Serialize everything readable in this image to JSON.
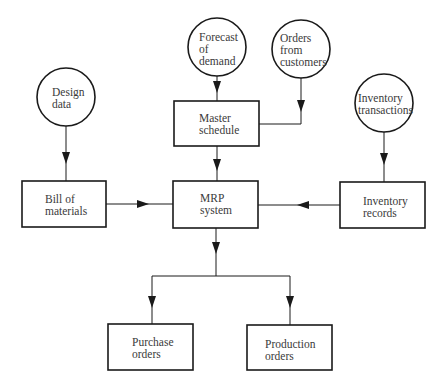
{
  "diagram": {
    "type": "flowchart",
    "title": "",
    "inputs": [
      {
        "id": "design_data",
        "shape": "circle",
        "label": "Design\ndata"
      },
      {
        "id": "forecast",
        "shape": "circle",
        "label": "Forecast\nof\ndemand"
      },
      {
        "id": "orders_customers",
        "shape": "circle",
        "label": "Orders\nfrom\ncustomers"
      },
      {
        "id": "inventory_transactions",
        "shape": "circle",
        "label": "Inventory\ntransactions"
      }
    ],
    "processes": [
      {
        "id": "master_schedule",
        "shape": "box",
        "label": "Master\nschedule"
      },
      {
        "id": "bill_of_materials",
        "shape": "box",
        "label": "Bill of\nmaterials"
      },
      {
        "id": "mrp_system",
        "shape": "box",
        "label": "MRP\nsystem"
      },
      {
        "id": "inventory_records",
        "shape": "box",
        "label": "Inventory\nrecords"
      }
    ],
    "outputs": [
      {
        "id": "purchase_orders",
        "shape": "box",
        "label": "Purchase\norders"
      },
      {
        "id": "production_orders",
        "shape": "box",
        "label": "Production\norders"
      }
    ],
    "edges": [
      {
        "from": "design_data",
        "to": "bill_of_materials"
      },
      {
        "from": "forecast",
        "to": "master_schedule"
      },
      {
        "from": "orders_customers",
        "to": "master_schedule"
      },
      {
        "from": "inventory_transactions",
        "to": "inventory_records"
      },
      {
        "from": "master_schedule",
        "to": "mrp_system"
      },
      {
        "from": "bill_of_materials",
        "to": "mrp_system"
      },
      {
        "from": "inventory_records",
        "to": "mrp_system"
      },
      {
        "from": "mrp_system",
        "to": "purchase_orders"
      },
      {
        "from": "mrp_system",
        "to": "production_orders"
      }
    ],
    "colors": {
      "line": "#1a1a1a",
      "background": "#ffffff"
    }
  }
}
